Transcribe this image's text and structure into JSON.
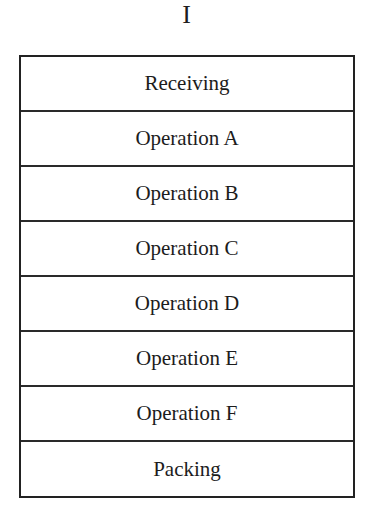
{
  "diagram": {
    "title": "I",
    "stages": [
      {
        "label": "Receiving"
      },
      {
        "label": "Operation A"
      },
      {
        "label": "Operation B"
      },
      {
        "label": "Operation C"
      },
      {
        "label": "Operation D"
      },
      {
        "label": "Operation E"
      },
      {
        "label": "Operation F"
      },
      {
        "label": "Packing"
      }
    ],
    "colors": {
      "border": "#222222",
      "text": "#1c1c1c",
      "background": "#ffffff"
    }
  }
}
